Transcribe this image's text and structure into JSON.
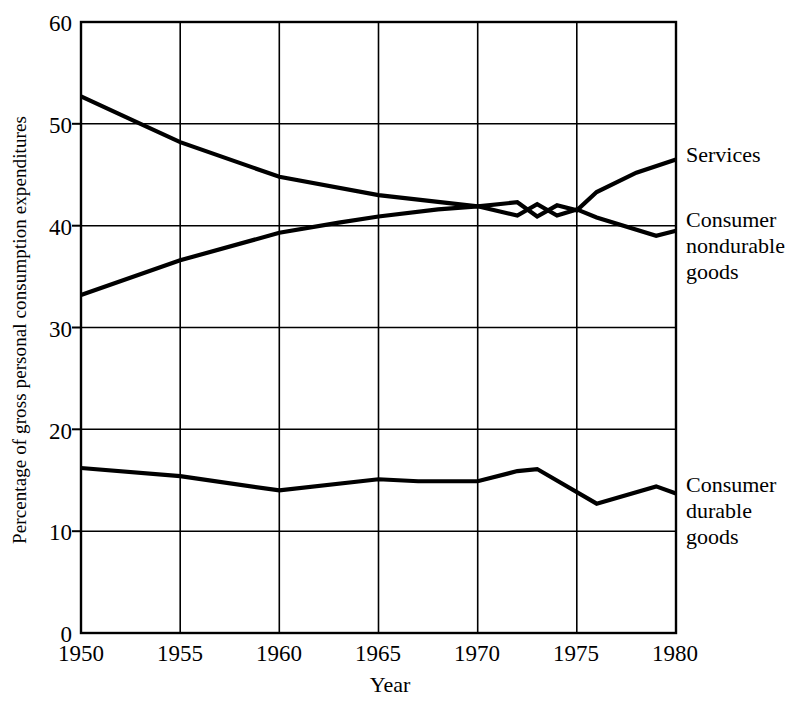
{
  "chart_data": {
    "type": "line",
    "title": "",
    "subtitle": "",
    "xlabel": "Year",
    "ylabel": "Percentage of gross personal consumption expenditures",
    "xlim": [
      1950,
      1980
    ],
    "ylim": [
      0,
      60
    ],
    "xticks": [
      1950,
      1955,
      1960,
      1965,
      1970,
      1975,
      1980
    ],
    "yticks": [
      0,
      10,
      20,
      30,
      40,
      50,
      60
    ],
    "xtick_labels": [
      "1950",
      "1955",
      "1960",
      "1965",
      "1970",
      "1975",
      "1980"
    ],
    "ytick_labels": [
      "0",
      "10",
      "20",
      "30",
      "40",
      "50",
      "60"
    ],
    "grid": true,
    "grid_style": "full vertical and horizontal rules inside frame",
    "legend_position": "right-of-plot inline labels at line ends",
    "line_color": "#000000",
    "series": [
      {
        "name": "Services",
        "label": "Services",
        "x": [
          1950,
          1955,
          1960,
          1963,
          1965,
          1968,
          1970,
          1972,
          1973,
          1974,
          1975,
          1976,
          1978,
          1980
        ],
        "values": [
          33.2,
          36.6,
          39.3,
          40.3,
          40.9,
          41.6,
          41.9,
          42.3,
          40.9,
          42.0,
          41.5,
          43.3,
          45.2,
          46.5
        ]
      },
      {
        "name": "Consumer nondurable goods",
        "label": "Consumer\nnondurable\ngoods",
        "x": [
          1950,
          1953,
          1955,
          1960,
          1965,
          1970,
          1972,
          1973,
          1974,
          1975,
          1976,
          1979,
          1980
        ],
        "values": [
          52.7,
          50.0,
          48.2,
          44.8,
          43.0,
          41.9,
          41.0,
          42.1,
          41.0,
          41.6,
          40.8,
          39.0,
          39.5
        ]
      },
      {
        "name": "Consumer durable goods",
        "label": "Consumer\ndurable\ngoods",
        "x": [
          1950,
          1955,
          1960,
          1965,
          1967,
          1970,
          1972,
          1973,
          1976,
          1979,
          1980
        ],
        "values": [
          16.2,
          15.4,
          14.0,
          15.1,
          14.9,
          14.9,
          15.9,
          16.1,
          12.7,
          14.4,
          13.7
        ]
      }
    ]
  },
  "axes": {
    "y_title": "Percentage of gross personal consumption expenditures",
    "x_title": "Year"
  },
  "labels": {
    "services": "Services",
    "nondurable": "Consumer\nnondurable\ngoods",
    "durable": "Consumer\ndurable\ngoods"
  }
}
